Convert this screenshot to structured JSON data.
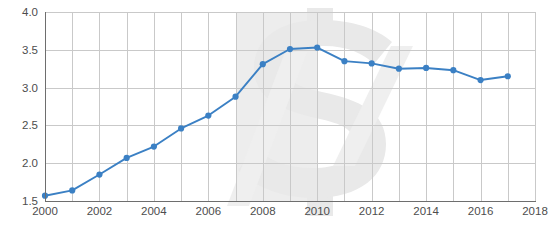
{
  "chart_data": {
    "type": "line",
    "title": "",
    "subtitle": "",
    "xlabel": "",
    "ylabel": "Billions of dollars",
    "x": [
      2000,
      2001,
      2002,
      2003,
      2004,
      2005,
      2006,
      2007,
      2008,
      2009,
      2010,
      2011,
      2012,
      2013,
      2014,
      2015,
      2016,
      2017
    ],
    "values": [
      1.57,
      1.64,
      1.85,
      2.07,
      2.22,
      2.46,
      2.63,
      2.88,
      3.31,
      3.51,
      3.53,
      3.35,
      3.32,
      3.25,
      3.26,
      3.23,
      3.1,
      3.15
    ],
    "series": [
      {
        "name": "Billions of dollars",
        "values": [
          1.57,
          1.64,
          1.85,
          2.07,
          2.22,
          2.46,
          2.63,
          2.88,
          3.31,
          3.51,
          3.53,
          3.35,
          3.32,
          3.25,
          3.26,
          3.23,
          3.1,
          3.15
        ]
      }
    ],
    "ylim": [
      1.5,
      4.0
    ],
    "xlim": [
      2000,
      2018
    ],
    "ytick_labels": [
      "4.0",
      "3.5",
      "3.0",
      "2.5",
      "2.0",
      "1.5"
    ],
    "ytick_values": [
      4.0,
      3.5,
      3.0,
      2.5,
      2.0,
      1.5
    ],
    "xtick_labels": [
      "2000",
      "2002",
      "2004",
      "2006",
      "2008",
      "2010",
      "2012",
      "2014",
      "2016",
      "2018"
    ],
    "xtick_values": [
      2000,
      2002,
      2004,
      2006,
      2008,
      2010,
      2012,
      2014,
      2016,
      2018
    ],
    "grid": true,
    "grid_x_step": 1,
    "legend": "none",
    "annotations": [
      {
        "name": "shaded-band",
        "type": "vertical-band",
        "x_start": 2007,
        "x_end": 2010,
        "color": "#e6e6e6"
      },
      {
        "name": "dollar-sign-watermark",
        "type": "watermark",
        "glyph": "$",
        "color": "#e8e8e8"
      }
    ],
    "colors": {
      "line": "#3b80c4",
      "marker": "#3b80c4",
      "grid": "#c9c9c9",
      "axis": "#6e6e6e",
      "band": "#e6e6e6",
      "text": "#4d4d4d"
    }
  }
}
